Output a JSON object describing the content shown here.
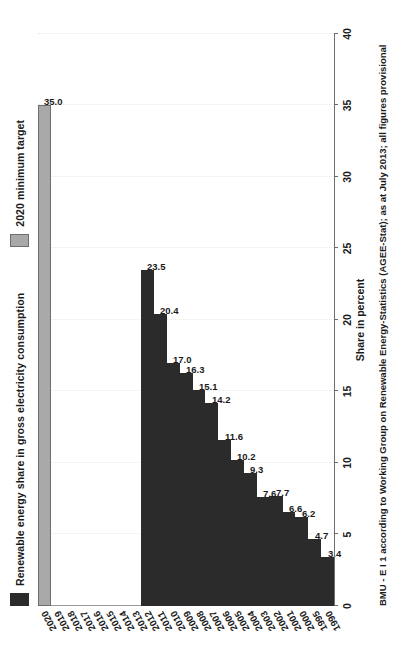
{
  "chart_data": {
    "type": "bar",
    "orientation": "horizontal",
    "title": "",
    "xlabel": "Share in percent",
    "ylabel": "",
    "xlim": [
      0,
      40
    ],
    "xticks": [
      0,
      5,
      10,
      15,
      20,
      25,
      30,
      35,
      40
    ],
    "grid": true,
    "legend_position": "top-left",
    "categories": [
      "1990",
      "1995",
      "2000",
      "2001",
      "2002",
      "2003",
      "2004",
      "2005",
      "2006",
      "2007",
      "2008",
      "2009",
      "2010",
      "2011",
      "2012",
      "2013",
      "2014",
      "2015",
      "2016",
      "2017",
      "2018",
      "2019",
      "2020"
    ],
    "series": [
      {
        "name": "Renewable energy share in gross electricity consumption",
        "color": "#2b2b2b",
        "values": [
          3.4,
          4.7,
          6.2,
          6.6,
          7.7,
          7.6,
          9.3,
          10.2,
          11.6,
          14.2,
          15.1,
          16.3,
          17.0,
          20.4,
          23.5,
          null,
          null,
          null,
          null,
          null,
          null,
          null,
          null
        ]
      },
      {
        "name": "2020 minimum target",
        "color": "#a8a8a8",
        "values": [
          null,
          null,
          null,
          null,
          null,
          null,
          null,
          null,
          null,
          null,
          null,
          null,
          null,
          null,
          null,
          null,
          null,
          null,
          null,
          null,
          null,
          null,
          35.0
        ]
      }
    ],
    "data_labels": [
      "3.4",
      "4.7",
      "6.2",
      "6.6",
      "7.7",
      "7.6",
      "9.3",
      "10.2",
      "11.6",
      "14.2",
      "15.1",
      "16.3",
      "17.0",
      "20.4",
      "23.5",
      "",
      "",
      "",
      "",
      "",
      "",
      "",
      "35.0"
    ],
    "annotations": [
      "BMU - E I 1 according to Working Group on Renewable Energy-Statistics (AGEE-Stat); as at July 2013; all figures provisional"
    ]
  },
  "legend": {
    "entries": [
      {
        "label": "Renewable energy share in gross electricity consumption",
        "swatch": "series"
      },
      {
        "label": "2020 minimum target",
        "swatch": "target"
      }
    ]
  },
  "axis": {
    "value_title": "Share in percent",
    "value_ticks": [
      "0",
      "5",
      "10",
      "15",
      "20",
      "25",
      "30",
      "35",
      "40"
    ]
  },
  "footnote": {
    "text": "BMU - E I 1 according to Working Group on Renewable Energy-Statistics (AGEE-Stat); as at July 2013; all figures provisional"
  },
  "colors": {
    "series_bar": "#2b2b2b",
    "target_bar": "#a8a8a8",
    "gridline": "#e9e9e9",
    "axis": "#6d6d6d",
    "text": "#1b1b1b",
    "background": "#ffffff"
  }
}
